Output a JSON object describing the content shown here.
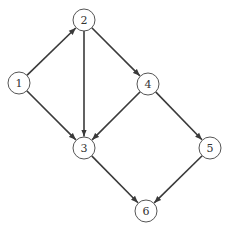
{
  "diagram": {
    "type": "directed-graph",
    "nodes": [
      {
        "id": "1",
        "label": "1",
        "x": 19,
        "y": 83
      },
      {
        "id": "2",
        "label": "2",
        "x": 84,
        "y": 20
      },
      {
        "id": "3",
        "label": "3",
        "x": 84,
        "y": 148
      },
      {
        "id": "4",
        "label": "4",
        "x": 148,
        "y": 84
      },
      {
        "id": "5",
        "label": "5",
        "x": 210,
        "y": 148
      },
      {
        "id": "6",
        "label": "6",
        "x": 146,
        "y": 211
      }
    ],
    "edges": [
      {
        "from": "1",
        "to": "2"
      },
      {
        "from": "1",
        "to": "3"
      },
      {
        "from": "2",
        "to": "3"
      },
      {
        "from": "2",
        "to": "4"
      },
      {
        "from": "4",
        "to": "3"
      },
      {
        "from": "4",
        "to": "5"
      },
      {
        "from": "3",
        "to": "6"
      },
      {
        "from": "5",
        "to": "6"
      }
    ],
    "node_radius": 11,
    "colors": {
      "edge": "#3a3a3a",
      "node_stroke": "#555555",
      "label": "#333333"
    }
  }
}
